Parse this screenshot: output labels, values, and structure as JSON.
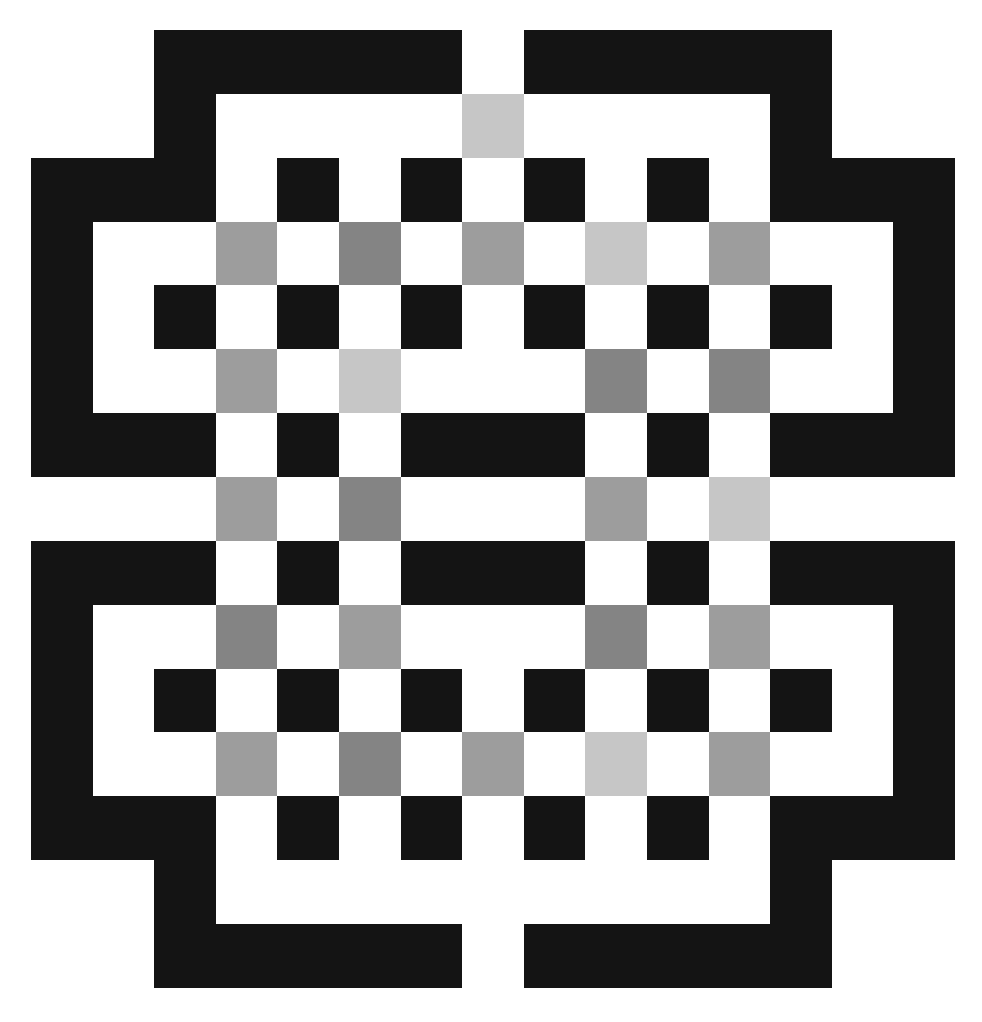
{
  "board": {
    "cols": 15,
    "rows": 15,
    "palette": {
      "K": "#141414",
      "W": "#ffffff",
      "L": "#c6c6c6",
      "M": "#9d9d9d",
      "D": "#848484"
    },
    "palette_names": {
      "K": "black",
      "W": "white",
      "L": "light-gray",
      "M": "mid-gray",
      "D": "dark-gray"
    },
    "grid": [
      "WWKKKKKWKKKKKWW",
      "WWKWWWWLWWWWKWW",
      "KKKWKWKWKWKWKKK",
      "KWWMWDWMWLWMWWK",
      "KWKWKWKWKWKWKWK",
      "KWWMWLWWWDWDWWK",
      "KKKWKWKKKWKWKKK",
      "WWWMWDWWWMWLWWW",
      "KKKWKWKKKWKWKKK",
      "KWWDWMWWWDWMWWK",
      "KWKWKWKWKWKWKWK",
      "KWWMWDWMWLWMWWK",
      "KKKWKWKWKWKWKKK",
      "WWKWWWWWWWWWKWW",
      "WWKKKKKWKKKKKWW"
    ]
  }
}
